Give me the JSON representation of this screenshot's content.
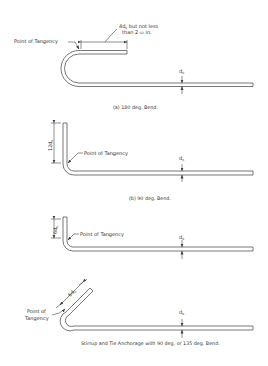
{
  "figures": [
    {
      "id": "a",
      "caption": "(a)  180 deg. Bend.",
      "tangency_label": "Point of Tangency",
      "extension_label_line1": "4d",
      "extension_label_sub1": "b",
      "extension_label_line1_rest": " but not less",
      "extension_label_line2": "than 2",
      "extension_label_frac": "1/2",
      "extension_label_line2_rest": " in.",
      "bar_diameter_label": "d",
      "bar_diameter_sub": "b"
    },
    {
      "id": "b",
      "caption": "(b)  90 deg. Bend.",
      "tangency_label": "Point of Tangency",
      "extension_label": "12d",
      "extension_sub": "b",
      "bar_diameter_label": "d",
      "bar_diameter_sub": "b"
    },
    {
      "id": "c",
      "caption": "",
      "tangency_label": "Point of Tangency",
      "extension_label": "6d",
      "extension_sub": "b",
      "bar_diameter_label": "d",
      "bar_diameter_sub": "b"
    },
    {
      "id": "d",
      "caption": "Stirrup and Tie Anchorage with 90 deg. or 135 deg. Bend.",
      "tangency_label_line1": "Point of",
      "tangency_label_line2": "Tangency",
      "extension_label": "6d",
      "extension_sub": "b",
      "bar_diameter_label": "d",
      "bar_diameter_sub": "b"
    }
  ]
}
